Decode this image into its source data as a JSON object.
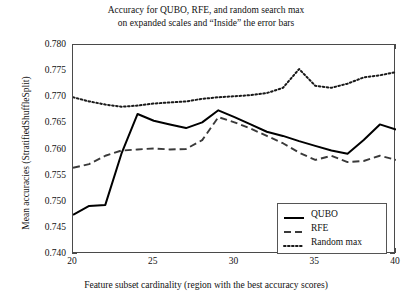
{
  "chart_data": {
    "type": "line",
    "title": "Accuracy for QUBO, RFE, and random search max\non expanded scales and “Inside” the error bars",
    "xlabel": "Feature subset cardinality (region with the best accuracy scores)",
    "ylabel": "Mean accuracies (StratifiedShuffleSplit)",
    "xlim": [
      20,
      40
    ],
    "ylim": [
      0.74,
      0.78
    ],
    "xticks": [
      20,
      25,
      30,
      35,
      40
    ],
    "xtick_labels": [
      "20",
      "25",
      "30",
      "35",
      "40"
    ],
    "yticks": [
      0.74,
      0.745,
      0.75,
      0.755,
      0.76,
      0.765,
      0.77,
      0.775,
      0.78
    ],
    "ytick_labels": [
      "0.740",
      "0.745",
      "0.750",
      "0.755",
      "0.760",
      "0.765",
      "0.770",
      "0.775",
      "0.780"
    ],
    "grid": false,
    "legend_position": "lower right",
    "x": [
      20,
      21,
      22,
      23,
      24,
      25,
      26,
      27,
      28,
      29,
      30,
      31,
      32,
      33,
      34,
      35,
      36,
      37,
      38,
      39,
      40
    ],
    "series": [
      {
        "name": "QUBO",
        "style": "solid",
        "color": "#000000",
        "values": [
          0.7475,
          0.7492,
          0.7494,
          0.7592,
          0.7668,
          0.7655,
          0.7648,
          0.7641,
          0.7652,
          0.7675,
          0.7662,
          0.7648,
          0.7634,
          0.7626,
          0.7616,
          0.7607,
          0.7598,
          0.7592,
          0.7618,
          0.7648,
          0.7638
        ]
      },
      {
        "name": "RFE",
        "style": "dashed",
        "color": "#3a3a3a",
        "values": [
          0.7565,
          0.7572,
          0.7588,
          0.7598,
          0.76,
          0.7602,
          0.76,
          0.7601,
          0.7618,
          0.7662,
          0.7652,
          0.764,
          0.7626,
          0.7612,
          0.7594,
          0.758,
          0.7588,
          0.7576,
          0.7578,
          0.7588,
          0.758
        ]
      },
      {
        "name": "Random max",
        "style": "dotted",
        "color": "#1a1a1a",
        "values": [
          0.77,
          0.7692,
          0.7686,
          0.7682,
          0.7684,
          0.7688,
          0.769,
          0.7692,
          0.7697,
          0.77,
          0.7702,
          0.7704,
          0.7708,
          0.7718,
          0.7754,
          0.7722,
          0.7718,
          0.7726,
          0.7738,
          0.7742,
          0.7748
        ]
      }
    ]
  },
  "legend": {
    "items": [
      {
        "label": "QUBO"
      },
      {
        "label": "RFE"
      },
      {
        "label": "Random max"
      }
    ]
  }
}
